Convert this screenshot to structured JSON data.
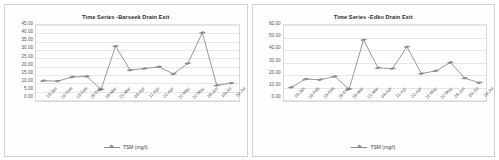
{
  "charts": [
    {
      "title": "Time Series -Barseek Drain Exit",
      "legend_label": "TSM (mg/l)",
      "chart_data": {
        "type": "line",
        "title": "Time Series -Barseek Drain Exit",
        "xlabel": "",
        "ylabel": "",
        "ylim": [
          0,
          45
        ],
        "ytick_labels": [
          "45.00",
          "40.00",
          "35.00",
          "30.00",
          "25.00",
          "20.00",
          "15.00",
          "10.00",
          "5.00",
          "0.00"
        ],
        "ytick_values": [
          45,
          40,
          35,
          30,
          25,
          20,
          15,
          10,
          5,
          0
        ],
        "grid": true,
        "legend": [
          "TSM (mg/l)"
        ],
        "legend_position": "bottom",
        "categories": [
          "19-Jan",
          "10-Feb",
          "23-Feb",
          "28-Feb",
          "18-Mar",
          "21-Mar",
          "03-Apr",
          "11-Apr",
          "22-Apr",
          "11-May",
          "22-May",
          "28-Jun",
          "09-Jul",
          "10-Jul"
        ],
        "series": [
          {
            "name": "TSM (mg/l)",
            "values": [
              12.0,
              11.8,
              14.2,
              14.6,
              6.8,
              32.5,
              18.3,
              19.2,
              20.2,
              16.0,
              22.3,
              40.4,
              9.2,
              10.6
            ]
          }
        ]
      }
    },
    {
      "title": "Time Series -Edko Drain Exit",
      "legend_label": "TSM (mg/l)",
      "chart_data": {
        "type": "line",
        "title": "Time Series -Edko Drain Exit",
        "xlabel": "",
        "ylabel": "",
        "ylim": [
          0,
          60
        ],
        "ytick_labels": [
          "60.00",
          "50.00",
          "40.00",
          "30.00",
          "20.00",
          "10.00",
          "0.00"
        ],
        "ytick_values": [
          60,
          50,
          40,
          30,
          20,
          10,
          0
        ],
        "grid": true,
        "legend": [
          "TSM (mg/l)"
        ],
        "legend_position": "bottom",
        "categories": [
          "19-Jan",
          "10-Feb",
          "23-Feb",
          "28-Feb",
          "18-Mar",
          "21-Mar",
          "03-Apr",
          "11-Apr",
          "22-Apr",
          "11-May",
          "22-May",
          "28-Jun",
          "09-Jul",
          "10-Jul"
        ],
        "series": [
          {
            "name": "TSM (mg/l)",
            "values": [
              10.8,
              17.3,
              16.8,
              19.4,
              9.3,
              48.3,
              26.1,
              25.6,
              42.8,
              21.6,
              23.8,
              30.4,
              18.0,
              14.4
            ]
          }
        ]
      }
    }
  ],
  "colors": {
    "series_line": "#8d8d8d",
    "gridline": "#e6e6e6",
    "plot_border": "#d8d8d8",
    "card_border": "#d2d2d2",
    "title_text": "#2b2b2b",
    "tick_text": "#555555"
  }
}
